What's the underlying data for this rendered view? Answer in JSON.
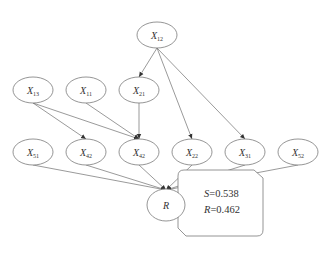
{
  "diagram": {
    "type": "bayesian-network",
    "nodes": [
      {
        "id": "X12",
        "base": "X",
        "sub": "12",
        "cx": 157,
        "cy": 35
      },
      {
        "id": "X13",
        "base": "X",
        "sub": "13",
        "cx": 33,
        "cy": 90
      },
      {
        "id": "X11",
        "base": "X",
        "sub": "11",
        "cx": 86,
        "cy": 90
      },
      {
        "id": "X21",
        "base": "X",
        "sub": "21",
        "cx": 139,
        "cy": 90
      },
      {
        "id": "X51",
        "base": "X",
        "sub": "51",
        "cx": 33,
        "cy": 152
      },
      {
        "id": "X42a",
        "base": "X",
        "sub": "42",
        "cx": 86,
        "cy": 152
      },
      {
        "id": "X42b",
        "base": "X",
        "sub": "42",
        "cx": 139,
        "cy": 152
      },
      {
        "id": "X22",
        "base": "X",
        "sub": "22",
        "cx": 192,
        "cy": 152
      },
      {
        "id": "X31",
        "base": "X",
        "sub": "31",
        "cx": 245,
        "cy": 152
      },
      {
        "id": "X52",
        "base": "X",
        "sub": "52",
        "cx": 298,
        "cy": 152
      },
      {
        "id": "R",
        "base": "R",
        "sub": "",
        "cx": 166,
        "cy": 205
      }
    ],
    "edges": [
      [
        "X12",
        "X21"
      ],
      [
        "X12",
        "X22"
      ],
      [
        "X12",
        "X31"
      ],
      [
        "X13",
        "X42a"
      ],
      [
        "X13",
        "X42b"
      ],
      [
        "X11",
        "X42b"
      ],
      [
        "X21",
        "X42b"
      ],
      [
        "X51",
        "R"
      ],
      [
        "X42a",
        "R"
      ],
      [
        "X42b",
        "R"
      ],
      [
        "X22",
        "R"
      ],
      [
        "X31",
        "R"
      ],
      [
        "X52",
        "R"
      ]
    ],
    "result_box": {
      "line1_var": "S",
      "line1_value": "=0.538",
      "line2_var": "R",
      "line2_value": "=0.462"
    }
  }
}
